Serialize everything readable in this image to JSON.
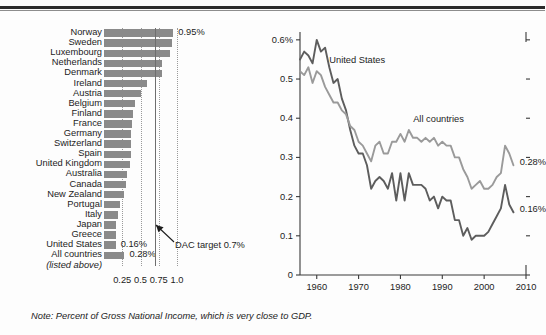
{
  "note": "Note: Percent of Gross National Income, which is very close to GDP.",
  "bar_panel": {
    "sublabel": "(listed above)",
    "dac_annotation": "DAC target 0.7%",
    "xticks": [
      "0.25",
      "0.5",
      "0.75",
      "1.0"
    ]
  },
  "line_panel": {
    "yticks": [
      "0.6%",
      "0.5",
      "0.4",
      "0.3",
      "0.2",
      "0.1",
      "0"
    ],
    "xticks": [
      "1960",
      "1970",
      "1980",
      "1990",
      "2000",
      "2010"
    ],
    "label_us": "United States",
    "label_all": "All countries",
    "end_label_all": "0.28%",
    "end_label_us": "0.16%"
  },
  "chart_data": [
    {
      "type": "bar",
      "title": "Official development assistance as percent of Gross National Income",
      "xlabel": "",
      "ylabel": "",
      "xlim": [
        0,
        1.1
      ],
      "grid": true,
      "orientation": "horizontal",
      "gridlines": [
        0.25,
        0.5,
        0.75,
        1.0
      ],
      "reference_line": {
        "value": 0.7,
        "label": "DAC target 0.7%"
      },
      "categories": [
        "Norway",
        "Sweden",
        "Luxembourg",
        "Netherlands",
        "Denmark",
        "Ireland",
        "Austria",
        "Belgium",
        "Finland",
        "France",
        "Germany",
        "Switzerland",
        "Spain",
        "United Kingdom",
        "Australia",
        "Canada",
        "New Zealand",
        "Portugal",
        "Italy",
        "Japan",
        "Greece",
        "United States",
        "All countries"
      ],
      "values": [
        0.95,
        0.93,
        0.9,
        0.8,
        0.8,
        0.59,
        0.5,
        0.43,
        0.4,
        0.39,
        0.37,
        0.37,
        0.37,
        0.36,
        0.32,
        0.3,
        0.27,
        0.22,
        0.19,
        0.17,
        0.16,
        0.16,
        0.28
      ],
      "data_labels": {
        "Norway": "0.95%",
        "United States": "0.16%",
        "All countries": "0.28%"
      }
    },
    {
      "type": "line",
      "title": "Official development assistance over time",
      "xlabel": "",
      "ylabel": "",
      "xlim": [
        1956,
        2010
      ],
      "ylim": [
        0,
        0.62
      ],
      "grid": false,
      "legend": "inline-annotation",
      "x": [
        1956,
        1957,
        1958,
        1959,
        1960,
        1961,
        1962,
        1963,
        1964,
        1965,
        1966,
        1967,
        1968,
        1969,
        1970,
        1971,
        1972,
        1973,
        1974,
        1975,
        1976,
        1977,
        1978,
        1979,
        1980,
        1981,
        1982,
        1983,
        1984,
        1985,
        1986,
        1987,
        1988,
        1989,
        1990,
        1991,
        1992,
        1993,
        1994,
        1995,
        1996,
        1997,
        1998,
        1999,
        2000,
        2001,
        2002,
        2003,
        2004,
        2005,
        2006,
        2007
      ],
      "series": [
        {
          "name": "United States",
          "values": [
            0.55,
            0.57,
            0.56,
            0.54,
            0.6,
            0.57,
            0.58,
            0.53,
            0.49,
            0.5,
            0.45,
            0.42,
            0.37,
            0.33,
            0.31,
            0.31,
            0.28,
            0.22,
            0.24,
            0.25,
            0.24,
            0.22,
            0.26,
            0.19,
            0.26,
            0.19,
            0.26,
            0.23,
            0.23,
            0.23,
            0.22,
            0.19,
            0.2,
            0.17,
            0.2,
            0.19,
            0.19,
            0.14,
            0.14,
            0.1,
            0.12,
            0.09,
            0.1,
            0.1,
            0.1,
            0.11,
            0.13,
            0.15,
            0.17,
            0.23,
            0.18,
            0.16
          ],
          "color": "#5d5d5d"
        },
        {
          "name": "All countries",
          "values": [
            0.52,
            0.51,
            0.53,
            0.49,
            0.52,
            0.51,
            0.48,
            0.46,
            0.44,
            0.44,
            0.42,
            0.41,
            0.38,
            0.37,
            0.34,
            0.33,
            0.31,
            0.29,
            0.33,
            0.34,
            0.31,
            0.31,
            0.34,
            0.34,
            0.36,
            0.34,
            0.37,
            0.35,
            0.35,
            0.34,
            0.35,
            0.34,
            0.35,
            0.33,
            0.34,
            0.33,
            0.33,
            0.3,
            0.3,
            0.27,
            0.25,
            0.22,
            0.23,
            0.24,
            0.22,
            0.22,
            0.23,
            0.25,
            0.26,
            0.33,
            0.31,
            0.28
          ],
          "color": "#9a9a9a"
        }
      ],
      "annotations": [
        {
          "text": "United States",
          "x": 1963,
          "y": 0.55
        },
        {
          "text": "All countries",
          "x": 1984,
          "y": 0.4
        },
        {
          "text": "0.28%",
          "x": 2008,
          "y": 0.28
        },
        {
          "text": "0.16%",
          "x": 2008,
          "y": 0.16
        }
      ]
    }
  ]
}
